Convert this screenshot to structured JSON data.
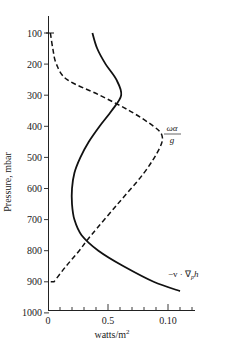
{
  "chart_data": {
    "type": "line",
    "title": "",
    "xlabel": "watts/m²",
    "ylabel": "Pressure, mbar",
    "xlim": [
      0,
      0.125
    ],
    "ylim": [
      1000,
      50
    ],
    "y_inverted": true,
    "grid": false,
    "legend": "inline annotations",
    "x_ticks": [
      {
        "value": 0,
        "label": "0"
      },
      {
        "value": 0.05,
        "label": "0.5"
      },
      {
        "value": 0.1,
        "label": "0.10"
      }
    ],
    "x_minor_step": 0.01,
    "y_ticks": [
      100,
      200,
      300,
      400,
      500,
      600,
      700,
      800,
      900,
      1000
    ],
    "series": [
      {
        "name": "-v · ∇_p h",
        "style": "solid",
        "points": [
          {
            "p": 100,
            "x": 0.037
          },
          {
            "p": 150,
            "x": 0.041
          },
          {
            "p": 200,
            "x": 0.048
          },
          {
            "p": 250,
            "x": 0.057
          },
          {
            "p": 300,
            "x": 0.061
          },
          {
            "p": 350,
            "x": 0.053
          },
          {
            "p": 400,
            "x": 0.043
          },
          {
            "p": 450,
            "x": 0.034
          },
          {
            "p": 500,
            "x": 0.027
          },
          {
            "p": 550,
            "x": 0.022
          },
          {
            "p": 600,
            "x": 0.02
          },
          {
            "p": 650,
            "x": 0.02
          },
          {
            "p": 700,
            "x": 0.022
          },
          {
            "p": 750,
            "x": 0.028
          },
          {
            "p": 800,
            "x": 0.042
          },
          {
            "p": 850,
            "x": 0.063
          },
          {
            "p": 900,
            "x": 0.088
          },
          {
            "p": 930,
            "x": 0.11
          }
        ]
      },
      {
        "name": "ωα/g",
        "style": "dashed",
        "points": [
          {
            "p": 100,
            "x": 0.002
          },
          {
            "p": 150,
            "x": 0.004
          },
          {
            "p": 200,
            "x": 0.007
          },
          {
            "p": 250,
            "x": 0.016
          },
          {
            "p": 300,
            "x": 0.043
          },
          {
            "p": 350,
            "x": 0.068
          },
          {
            "p": 400,
            "x": 0.088
          },
          {
            "p": 430,
            "x": 0.095
          },
          {
            "p": 470,
            "x": 0.093
          },
          {
            "p": 550,
            "x": 0.08
          },
          {
            "p": 650,
            "x": 0.058
          },
          {
            "p": 750,
            "x": 0.036
          },
          {
            "p": 800,
            "x": 0.026
          },
          {
            "p": 850,
            "x": 0.015
          },
          {
            "p": 900,
            "x": 0.005
          },
          {
            "p": 900,
            "x": 0.0
          }
        ]
      }
    ],
    "annotations": [
      {
        "text": "ωα/g",
        "near_series": "ωα/g",
        "p": 430,
        "x": 0.1
      },
      {
        "text": "−v · ∇ₚh",
        "near_series": "-v · ∇_p h",
        "p": 880,
        "x": 0.1
      }
    ]
  },
  "labels": {
    "ylabel": "Pressure, mbar",
    "xlabel": "watts/m",
    "xlabel_sup": "2",
    "anno_omega_num": "ωα",
    "anno_omega_den": "g",
    "anno_adv": "−v · ∇",
    "anno_adv_sub": "p",
    "anno_adv_h": "h"
  }
}
